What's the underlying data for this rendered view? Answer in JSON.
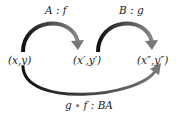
{
  "nodes": [
    {
      "id": "n1",
      "label": "(x,y)"
    },
    {
      "id": "n2",
      "label": "(x′,y′)"
    },
    {
      "id": "n3",
      "label": "(x″,y″)"
    }
  ],
  "edges": [
    {
      "id": "e1",
      "from": "n1",
      "to": "n2",
      "label": "A : f"
    },
    {
      "id": "e2",
      "from": "n2",
      "to": "n3",
      "label": "B : g"
    },
    {
      "id": "e3",
      "from": "n1",
      "to": "n3",
      "label": "g ∘ f : BA"
    }
  ],
  "colors": {
    "arrow_start": "#111111",
    "arrow_end": "#777777",
    "text": "#222222"
  }
}
